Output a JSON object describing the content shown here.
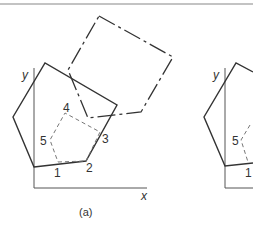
{
  "figure": {
    "panel_a": {
      "caption": "(a)",
      "axis_x_label": "x",
      "axis_y_label": "y",
      "vertex_labels": [
        "1",
        "2",
        "3",
        "4",
        "5"
      ]
    },
    "panel_b": {
      "axis_y_label": "y",
      "vertex_labels": [
        "1",
        "5"
      ]
    }
  },
  "colors": {
    "stroke": "#333333",
    "dashed": "#777777",
    "rule": "#888888"
  }
}
